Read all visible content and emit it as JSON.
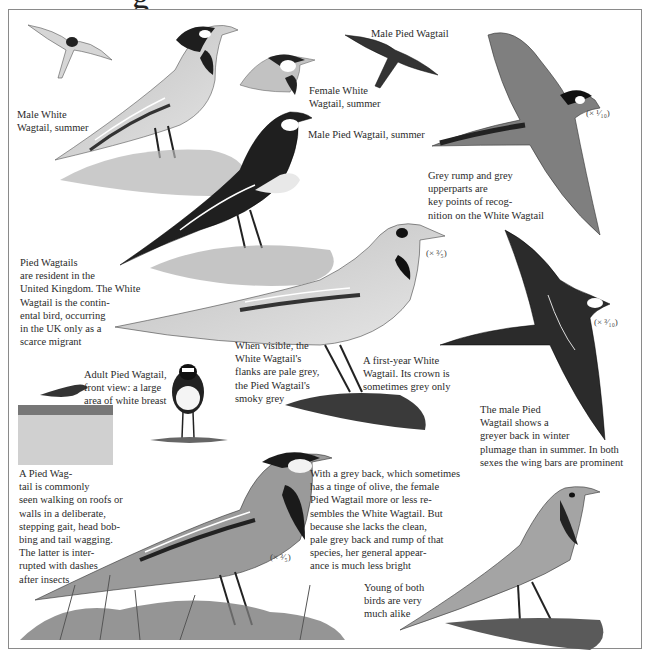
{
  "page": {
    "heading_fragment": "g"
  },
  "captions": {
    "male_white_summer": "Male White\nWagtail, summer",
    "male_pied_flight": "Male Pied Wagtail",
    "female_white_summer": "Female White\nWagtail, summer",
    "male_pied_summer": "Male Pied Wagtail, summer",
    "grey_rump": "Grey rump and grey\nupperparts are\nkey points of recog-\nnition on the White Wagtail",
    "resident": "Pied Wagtails\nare resident in the\nUnited Kingdom. The White\nWagtail is the contin-\nental bird, occurring\nin the UK only as a\nscarce migrant",
    "flanks": "When visible, the\nWhite Wagtail's\nflanks are pale grey,\nthe Pied Wagtail's\nsmoky grey",
    "first_year": "A first-year White\nWagtail. Its crown is\nsometimes grey only",
    "front_view": "Adult Pied Wagtail,\nfront view: a large\narea of white breast",
    "male_pied_winter": "The male Pied\nWagtail shows a\ngreyer back in winter\nplumage than in summer. In both\nsexes the wing bars are prominent",
    "roofs": "A Pied Wag-\ntail is commonly\nseen walking on roofs or\nwalls in a deliberate,\nstepping gait, head bob-\nbing and tail wagging.\nThe latter is inter-\nrupted with dashes\nafter insects",
    "female_pied": "With a grey back, which sometimes\nhas a tinge of olive, the female\nPied Wagtail more or less re-\nsembles the White Wagtail. But\nbecause she lacks the clean,\npale grey back and rump of that\nspecies, her general appear-\nance is much less bright",
    "young": "Young of both\nbirds are very\nmuch alike"
  },
  "scales": {
    "flight_white": "(× ¹⁄₁₀)",
    "first_year": "(× ³⁄₅)",
    "flight_pied": "(× ³⁄₁₀)",
    "female_pied": "(× ³⁄₅)"
  },
  "colors": {
    "ink": "#2b2b2b",
    "frame": "#8a8a8a",
    "grey_light": "#c9c9c9",
    "grey_mid": "#8d8d8d",
    "black": "#1a1a1a"
  }
}
